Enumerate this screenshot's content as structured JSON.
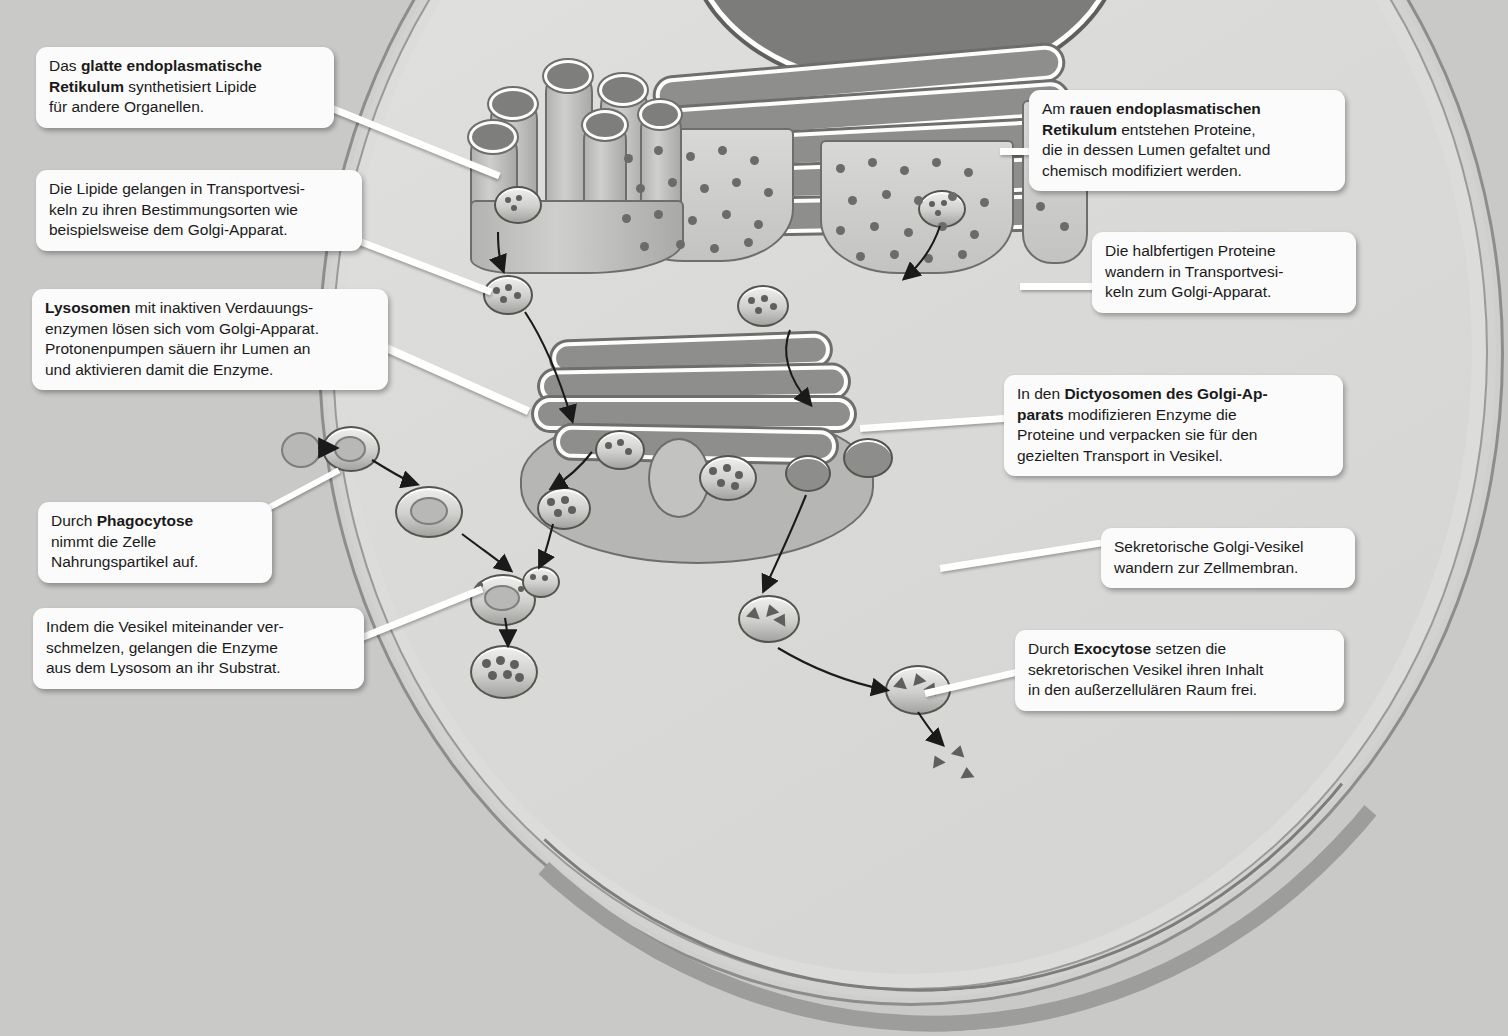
{
  "diagram": {
    "language": "de",
    "colors": {
      "background": "#c9c9c7",
      "cytosol": "#dcdcda",
      "membrane": "#9d9d9b",
      "organelle_dark": "#7c7c7a",
      "callout_background": "#fbfbfb",
      "text": "#1a1a1a"
    }
  },
  "callouts": [
    {
      "id": "smooth-er",
      "side": "left",
      "lines": [
        [
          {
            "t": "Das ",
            "b": false
          },
          {
            "t": "glatte endoplasmatische",
            "b": true
          }
        ],
        [
          {
            "t": "Retikulum",
            "b": true
          },
          {
            "t": " synthetisiert Lipide",
            "b": false
          }
        ],
        [
          {
            "t": "für andere Organellen.",
            "b": false
          }
        ]
      ]
    },
    {
      "id": "transport-vesicles-lipids",
      "side": "left",
      "lines": [
        [
          {
            "t": "Die Lipide gelangen in Transportvesi-",
            "b": false
          }
        ],
        [
          {
            "t": "keln zu ihren Bestimmungsorten wie",
            "b": false
          }
        ],
        [
          {
            "t": "beispielsweise dem Golgi-Apparat.",
            "b": false
          }
        ]
      ]
    },
    {
      "id": "lysosomes",
      "side": "left",
      "lines": [
        [
          {
            "t": "Lysosomen",
            "b": true
          },
          {
            "t": " mit inaktiven Verdauungs-",
            "b": false
          }
        ],
        [
          {
            "t": "enzymen lösen sich vom Golgi-Apparat.",
            "b": false
          }
        ],
        [
          {
            "t": "Protonenpumpen säuern ihr Lumen an",
            "b": false
          }
        ],
        [
          {
            "t": "und aktivieren damit die Enzyme.",
            "b": false
          }
        ]
      ]
    },
    {
      "id": "phagocytosis",
      "side": "left",
      "lines": [
        [
          {
            "t": "Durch ",
            "b": false
          },
          {
            "t": "Phagocytose",
            "b": true
          }
        ],
        [
          {
            "t": "nimmt die Zelle",
            "b": false
          }
        ],
        [
          {
            "t": "Nahrungspartikel auf.",
            "b": false
          }
        ]
      ]
    },
    {
      "id": "vesicle-fusion",
      "side": "left",
      "lines": [
        [
          {
            "t": "Indem die Vesikel miteinander ver-",
            "b": false
          }
        ],
        [
          {
            "t": "schmelzen, gelangen die Enzyme",
            "b": false
          }
        ],
        [
          {
            "t": "aus dem Lysosom an ihr Substrat.",
            "b": false
          }
        ]
      ]
    },
    {
      "id": "rough-er",
      "side": "right",
      "lines": [
        [
          {
            "t": "Am ",
            "b": false
          },
          {
            "t": "rauen endoplasmatischen",
            "b": true
          }
        ],
        [
          {
            "t": "Retikulum",
            "b": true
          },
          {
            "t": " entstehen Proteine,",
            "b": false
          }
        ],
        [
          {
            "t": "die in dessen Lumen gefaltet und",
            "b": false
          }
        ],
        [
          {
            "t": "chemisch modifiziert werden.",
            "b": false
          }
        ]
      ]
    },
    {
      "id": "protein-transport",
      "side": "right",
      "lines": [
        [
          {
            "t": "Die halbfertigen Proteine",
            "b": false
          }
        ],
        [
          {
            "t": "wandern in Transportvesi-",
            "b": false
          }
        ],
        [
          {
            "t": "keln zum Golgi-Apparat.",
            "b": false
          }
        ]
      ]
    },
    {
      "id": "dictyosomes",
      "side": "right",
      "lines": [
        [
          {
            "t": "In den ",
            "b": false
          },
          {
            "t": "Dictyosomen des Golgi-Ap-",
            "b": true
          }
        ],
        [
          {
            "t": "parats",
            "b": true
          },
          {
            "t": " modifizieren Enzyme die",
            "b": false
          }
        ],
        [
          {
            "t": "Proteine und verpacken sie für den",
            "b": false
          }
        ],
        [
          {
            "t": "gezielten Transport in Vesikel.",
            "b": false
          }
        ]
      ]
    },
    {
      "id": "secretory-vesicles",
      "side": "right",
      "lines": [
        [
          {
            "t": "Sekretorische Golgi-Vesikel",
            "b": false
          }
        ],
        [
          {
            "t": "wandern zur Zellmembran.",
            "b": false
          }
        ]
      ]
    },
    {
      "id": "exocytosis",
      "side": "right",
      "lines": [
        [
          {
            "t": "Durch ",
            "b": false
          },
          {
            "t": "Exocytose",
            "b": true
          },
          {
            "t": " setzen die",
            "b": false
          }
        ],
        [
          {
            "t": "sekretorischen Vesikel ihren Inhalt",
            "b": false
          }
        ],
        [
          {
            "t": "in den außerzellulären Raum frei.",
            "b": false
          }
        ]
      ]
    }
  ],
  "structures": [
    {
      "name": "smooth-endoplasmic-reticulum",
      "label": "glattes endoplasmatisches Retikulum"
    },
    {
      "name": "rough-endoplasmic-reticulum",
      "label": "raues endoplasmatisches Retikulum"
    },
    {
      "name": "nucleus",
      "label": "Zellkern"
    },
    {
      "name": "golgi-apparatus",
      "label": "Golgi-Apparat"
    },
    {
      "name": "lysosome",
      "label": "Lysosom"
    },
    {
      "name": "phagosome",
      "label": "Phagosom"
    },
    {
      "name": "secretory-vesicle",
      "label": "sekretorisches Vesikel"
    },
    {
      "name": "cell-membrane",
      "label": "Zellmembran"
    },
    {
      "name": "food-particle",
      "label": "Nahrungspartikel"
    }
  ]
}
